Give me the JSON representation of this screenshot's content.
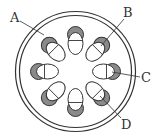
{
  "diagram": {
    "type": "cross-section",
    "colors": {
      "stroke": "#333333",
      "fill_light": "#ffffff",
      "fill_dark": "#8a8a8a",
      "label": "#333333"
    },
    "center": [
      75.5,
      71.5
    ],
    "outer_ring_radius": 60,
    "inner_ring_radius": 56,
    "bundle_count": 8,
    "bundle_distance": 31,
    "bundle_angles_deg": [
      -90,
      -45,
      0,
      45,
      90,
      135,
      180,
      225
    ],
    "labels": [
      {
        "text": "A",
        "x": 10,
        "y": 22,
        "line": [
          20,
          21,
          44,
          35
        ]
      },
      {
        "text": "B",
        "x": 123,
        "y": 17,
        "line": [
          124,
          19,
          101,
          46
        ]
      },
      {
        "text": "C",
        "x": 141,
        "y": 82,
        "line": [
          112,
          72,
          140,
          77
        ]
      },
      {
        "text": "D",
        "x": 121,
        "y": 129,
        "line": [
          121,
          118,
          100,
          96
        ]
      }
    ]
  }
}
